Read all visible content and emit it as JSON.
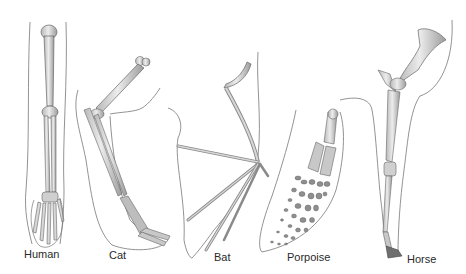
{
  "figure": {
    "limbs": [
      {
        "id": "human",
        "label": "Human"
      },
      {
        "id": "cat",
        "label": "Cat"
      },
      {
        "id": "bat",
        "label": "Bat"
      },
      {
        "id": "porpoise",
        "label": "Porpoise"
      },
      {
        "id": "horse",
        "label": "Horse"
      }
    ],
    "colors": {
      "background": "#ffffff",
      "bone_fill": "#e2e2e2",
      "bone_shade": "#a9a9a9",
      "outline": "#555555",
      "label": "#2a2a2a"
    }
  }
}
